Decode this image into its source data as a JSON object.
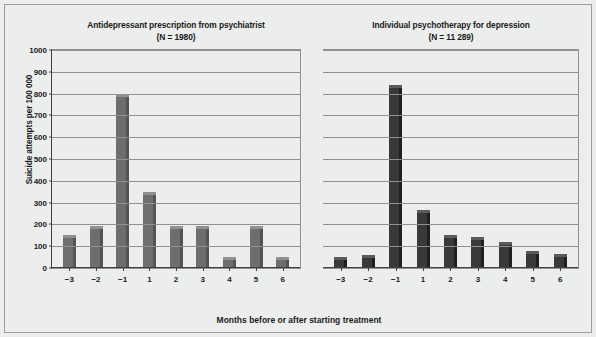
{
  "figure": {
    "y_axis_title": "Suicide attempts per 100 000",
    "x_axis_title": "Months before or after starting treatment"
  },
  "chart_data": [
    {
      "type": "bar",
      "title": "Antidepressant prescription from psychiatrist",
      "subtitle": "(N = 1980)",
      "xlabel": "Months before or after starting treatment",
      "ylabel": "Suicide attempts per 100 000",
      "ylim": [
        0,
        1000
      ],
      "yticks": [
        0,
        100,
        200,
        300,
        400,
        500,
        600,
        700,
        800,
        900,
        1000
      ],
      "grid": true,
      "legend": "none",
      "bar_color": "#6d6f6e",
      "categories": [
        "−3",
        "−2",
        "−1",
        "1",
        "2",
        "3",
        "4",
        "5",
        "6"
      ],
      "values": [
        150,
        195,
        800,
        350,
        195,
        195,
        50,
        195,
        50
      ]
    },
    {
      "type": "bar",
      "title": "Individual psychotherapy for depression",
      "subtitle": "(N = 11 289)",
      "xlabel": "Months before or after starting treatment",
      "ylabel": "Suicide attempts per 100 000",
      "ylim": [
        0,
        1000
      ],
      "yticks": [
        0,
        100,
        200,
        300,
        400,
        500,
        600,
        700,
        800,
        900,
        1000
      ],
      "grid": true,
      "legend": "none",
      "bar_color": "#383a39",
      "categories": [
        "−3",
        "−2",
        "−1",
        "1",
        "2",
        "3",
        "4",
        "5",
        "6"
      ],
      "values": [
        50,
        60,
        840,
        265,
        150,
        140,
        120,
        80,
        65
      ]
    }
  ]
}
